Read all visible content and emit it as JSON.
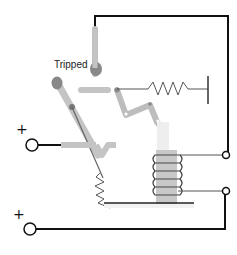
{
  "diagram": {
    "labels": {
      "state": "Tripped",
      "terminal_top": "+",
      "terminal_bottom": "+"
    },
    "components": [
      {
        "name": "fixed-contact",
        "description": "vertical gray contact post"
      },
      {
        "name": "moving-contact-arm",
        "description": "pivoting diagonal arm"
      },
      {
        "name": "latch-bar",
        "description": "horizontal gray latch"
      },
      {
        "name": "trip-linkage",
        "description": "zig-zag lever linkage"
      },
      {
        "name": "tension-spring",
        "description": "horizontal spring anchored to wall"
      },
      {
        "name": "return-spring",
        "description": "spring under contact arm"
      },
      {
        "name": "solenoid-coil",
        "description": "electromagnet coil with plunger"
      },
      {
        "name": "base-plate",
        "description": "horizontal mounting base"
      },
      {
        "name": "input-terminal-top",
        "description": "positive terminal"
      },
      {
        "name": "input-terminal-bottom",
        "description": "positive terminal"
      },
      {
        "name": "coil-terminals",
        "description": "two open terminals on right"
      }
    ],
    "colors": {
      "wire": "#111111",
      "mechanism": "#bdbdbd",
      "mechanism_dark": "#8c8c8c",
      "pivot": "#777777",
      "spring": "#555555",
      "coil_core": "#c8c8c8",
      "coil_wire": "#444444",
      "background": "#ffffff"
    }
  }
}
